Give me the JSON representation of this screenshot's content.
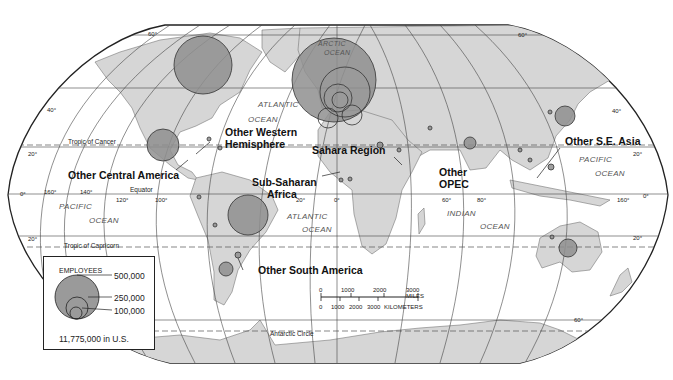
{
  "map": {
    "title": "Employees of U.S. Multinational Corporations Abroad",
    "projection": "Robinson",
    "colors": {
      "land": "#d6d6d6",
      "water": "#ffffff",
      "bubble": "#8f8f8f",
      "bubble_stroke": "#333333",
      "grid": "#444444"
    }
  },
  "region_labels": {
    "other_western_hemisphere": "Other Western Hemisphere",
    "other_western_hemisphere_l1": "Other Western",
    "other_western_hemisphere_l2": "Hemisphere",
    "other_central_america": "Other Central America",
    "sahara_region": "Sahara Region",
    "sub_saharan_africa_l1": "Sub-Saharan",
    "sub_saharan_africa_l2": "Africa",
    "other_opec_l1": "Other",
    "other_opec_l2": "OPEC",
    "other_se_asia": "Other S.E. Asia",
    "other_south_america": "Other South America"
  },
  "ocean_labels": {
    "arctic_l1": "ARCTIC",
    "arctic_l2": "OCEAN",
    "atlantic_n_l1": "ATLANTIC",
    "atlantic_n_l2": "OCEAN",
    "atlantic_s_l1": "ATLANTIC",
    "atlantic_s_l2": "OCEAN",
    "pacific_e_l1": "PACIFIC",
    "pacific_e_l2": "OCEAN",
    "pacific_w_l1": "PACIFIC",
    "pacific_w_l2": "OCEAN",
    "indian_l1": "INDIAN",
    "indian_l2": "OCEAN"
  },
  "reference_lines": {
    "tropic_cancer": "Tropic of Cancer",
    "tropic_capricorn": "Tropic of Capricorn",
    "equator": "Equator",
    "antarctic_circle": "Antarctic Circle"
  },
  "graticule_labels": {
    "lat_60n_w": "60°",
    "lat_40n_w": "40°",
    "lat_20n_w": "20°",
    "lat_0_w": "0°",
    "lat_20s_w": "20°",
    "lat_60n_e": "60°",
    "lat_40n_e": "40°",
    "lat_20n_e": "20°",
    "lat_0_e": "0°",
    "lat_20s_e": "20°",
    "lat_60s_e": "60°",
    "lon_160w": "160°",
    "lon_140w": "140°",
    "lon_120w": "120°",
    "lon_100w": "100°",
    "lon_20w": "20°",
    "lon_0": "0°",
    "lon_60e": "60°",
    "lon_80e": "80°",
    "lon_160e": "160°"
  },
  "legend": {
    "title": "EMPLOYEES",
    "values": [
      "500,000",
      "250,000",
      "100,000"
    ],
    "us_note": "11,775,000 in U.S."
  },
  "scale_bar": {
    "miles": [
      "0",
      "1000",
      "2000",
      "3000 MILES"
    ],
    "kilometers": [
      "0",
      "1000",
      "2000",
      "3000",
      "KILOMETERS"
    ]
  },
  "bubbles": [
    {
      "region": "Canada",
      "cx": 203,
      "cy": 65,
      "r": 29
    },
    {
      "region": "Europe (total)",
      "cx": 334,
      "cy": 80,
      "r": 42
    },
    {
      "region": "Mexico",
      "cx": 163,
      "cy": 145,
      "r": 16
    },
    {
      "region": "Brazil",
      "cx": 248,
      "cy": 215,
      "r": 20
    },
    {
      "region": "Argentina",
      "cx": 226,
      "cy": 269,
      "r": 7
    },
    {
      "region": "Japan",
      "cx": 565,
      "cy": 116,
      "r": 10
    },
    {
      "region": "Australia",
      "cx": 568,
      "cy": 248,
      "r": 9
    },
    {
      "region": "India",
      "cx": 470,
      "cy": 143,
      "r": 6
    }
  ]
}
